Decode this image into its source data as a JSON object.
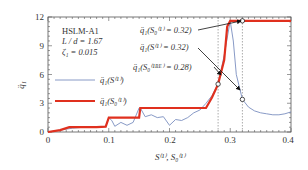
{
  "chart_data": {
    "type": "line",
    "title": "",
    "xlabel": "S(1), S0(1)",
    "ylabel": "q̈1 (bar)",
    "xlim": [
      0,
      0.4
    ],
    "ylim": [
      0,
      12
    ],
    "x_ticks": [
      "0",
      "0.1",
      "0.2",
      "0.3",
      "0.4"
    ],
    "y_ticks": [
      "0",
      "3",
      "6",
      "9",
      "12"
    ],
    "grid": false,
    "legend_position": "middle-left",
    "info_text": [
      "HSLM-A1",
      "L / d = 1.67",
      "ζ1 = 0.015"
    ],
    "series": [
      {
        "name": "q̈1(S(1))",
        "color": "#7a8fc0",
        "x": [
          0,
          0.02,
          0.04,
          0.06,
          0.08,
          0.095,
          0.1,
          0.105,
          0.11,
          0.12,
          0.13,
          0.14,
          0.15,
          0.152,
          0.16,
          0.17,
          0.18,
          0.19,
          0.2,
          0.21,
          0.22,
          0.23,
          0.24,
          0.25,
          0.26,
          0.27,
          0.28,
          0.29,
          0.3,
          0.305,
          0.31,
          0.32,
          0.33,
          0.34,
          0.35,
          0.36,
          0.37,
          0.38,
          0.39,
          0.4
        ],
        "y": [
          0,
          0.2,
          0.4,
          0.5,
          0.5,
          0.6,
          1.5,
          1.2,
          0.6,
          1.0,
          0.7,
          1.0,
          2.5,
          2.5,
          1.6,
          1.8,
          1.5,
          1.6,
          0.7,
          1.3,
          1.2,
          1.5,
          2.0,
          2.3,
          3.0,
          3.8,
          5.0,
          8.0,
          11.6,
          9.5,
          6.0,
          3.4,
          2.6,
          2.2,
          2.0,
          1.9,
          1.8,
          1.8,
          1.9,
          2.1
        ]
      },
      {
        "name": "q̈1(S0(1))",
        "color": "#e0301e",
        "x": [
          0,
          0.02,
          0.035,
          0.06,
          0.08,
          0.095,
          0.1,
          0.15,
          0.152,
          0.2,
          0.26,
          0.27,
          0.28,
          0.29,
          0.295,
          0.3,
          0.32,
          0.4
        ],
        "y": [
          0,
          0.2,
          0.5,
          0.5,
          0.5,
          0.55,
          1.5,
          1.5,
          2.5,
          2.5,
          2.5,
          3.6,
          5.0,
          7.5,
          11.0,
          11.6,
          11.6,
          11.6
        ]
      }
    ],
    "annotations": [
      {
        "text": "q̈1(S0(1) = 0.32)",
        "x": 0.32,
        "y": 11.6
      },
      {
        "text": "q̈1(S(1) = 0.32)",
        "x": 0.32,
        "y": 3.4
      },
      {
        "text": "q̈1(S0(1BE) = 0.28)",
        "x": 0.28,
        "y": 5.0
      }
    ],
    "vlines": [
      0.28,
      0.32
    ]
  },
  "labels": {
    "y12": "12",
    "y9": "9",
    "y6": "6",
    "y3": "3",
    "y0": "0",
    "x0": "0",
    "x01": "0.1",
    "x02": "0.2",
    "x03": "0.3",
    "x04": "0.4",
    "info1": "HSLM-A1",
    "info2": "L / d = 1.67",
    "info3": "ζ₁ = 0.015",
    "ylab": "q̈₁",
    "xlab": "S⁽¹⁾, S₀⁽¹⁾",
    "leg1": "q̈₁(S⁽¹⁾)",
    "leg2": "q̈₁(S₀⁽¹⁾)",
    "ann1": "q̈₁(S₀⁽¹⁾ = 0.32)",
    "ann2": "q̈₁(S⁽¹⁾ = 0.32)",
    "ann3": "q̈₁(S₀⁽¹ᴮᴱ⁾ = 0.28)"
  }
}
